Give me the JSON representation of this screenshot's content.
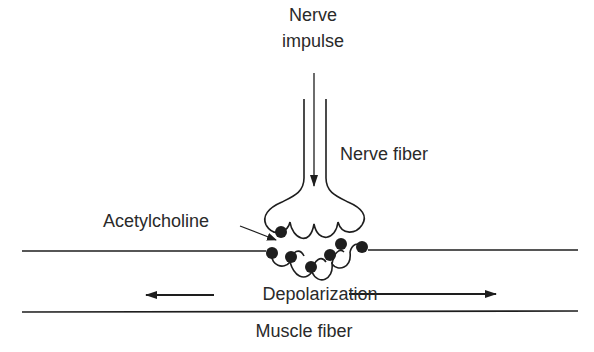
{
  "labels": {
    "nerve_impulse_line1": "Nerve",
    "nerve_impulse_line2": "impulse",
    "nerve_fiber": "Nerve fiber",
    "acetylcholine": "Acetylcholine",
    "depolarization": "Depolarization",
    "muscle_fiber": "Muscle fiber"
  },
  "colors": {
    "stroke": "#1e1e1e",
    "text": "#2a2a2a",
    "background": "#ffffff"
  }
}
